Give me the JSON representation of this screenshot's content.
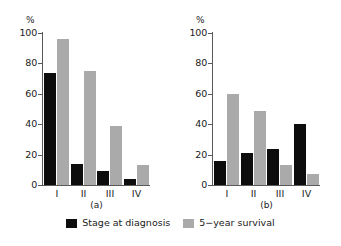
{
  "chart_data": {
    "type": "bar",
    "title": "",
    "subtitle": "",
    "xlabel": "",
    "ylabel": "%",
    "unit_label": "%",
    "ylim": [
      0,
      100
    ],
    "yticks": [
      0,
      20,
      40,
      60,
      80,
      100
    ],
    "ytick_labels": [
      "0",
      "20",
      "40",
      "60",
      "80",
      "100"
    ],
    "grid": false,
    "legend_position": "bottom-center",
    "categories": [
      "I",
      "II",
      "III",
      "IV"
    ],
    "legend": [
      "Stage at diagnosis",
      "5−year survival"
    ],
    "colors": {
      "stage_at_diagnosis": "#0d0d0d",
      "five_year_survival": "#aaaaaa",
      "axis": "#595959",
      "text": "#1a1a1a",
      "background": "#ffffff"
    },
    "panels": [
      {
        "caption": "(a)",
        "categories": [
          "I",
          "II",
          "III",
          "IV"
        ],
        "series": [
          {
            "name": "Stage at diagnosis",
            "values": [
              74,
              14,
              9,
              4
            ]
          },
          {
            "name": "5−year survival",
            "values": [
              96,
              75,
              39,
              13
            ]
          }
        ]
      },
      {
        "caption": "(b)",
        "categories": [
          "I",
          "II",
          "III",
          "IV"
        ],
        "series": [
          {
            "name": "Stage at diagnosis",
            "values": [
              16,
              21,
              24,
              40
            ]
          },
          {
            "name": "5−year survival",
            "values": [
              60,
              49,
              13,
              7
            ]
          }
        ]
      }
    ]
  }
}
